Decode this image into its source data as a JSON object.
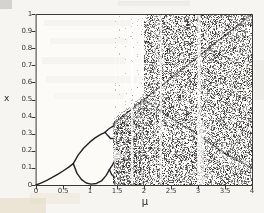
{
  "figure": {
    "paper_color": "#f6f5f1",
    "plot_bg": "#fcfbf8",
    "ink": "#232323",
    "tick_label_color": "#3a3a3a",
    "scan_artifacts": [
      {
        "x": 0,
        "y": 0,
        "w": 12,
        "h": 9,
        "color": "#6f6f6f",
        "opacity": 0.25
      },
      {
        "x": 118,
        "y": 1,
        "w": 72,
        "h": 5,
        "color": "#9a9a9a",
        "opacity": 0.1
      },
      {
        "x": 44,
        "y": 20,
        "w": 90,
        "h": 6,
        "color": "#9a9a9a",
        "opacity": 0.07
      },
      {
        "x": 50,
        "y": 38,
        "w": 78,
        "h": 6,
        "color": "#9a9a9a",
        "opacity": 0.06
      },
      {
        "x": 42,
        "y": 57,
        "w": 84,
        "h": 7,
        "color": "#9a9a9a",
        "opacity": 0.07
      },
      {
        "x": 46,
        "y": 76,
        "w": 96,
        "h": 7,
        "color": "#9a9a9a",
        "opacity": 0.06
      },
      {
        "x": 54,
        "y": 93,
        "w": 70,
        "h": 6,
        "color": "#9a9a9a",
        "opacity": 0.05
      },
      {
        "x": 0,
        "y": 198,
        "w": 46,
        "h": 15,
        "color": "#e0d3b6",
        "opacity": 0.45
      },
      {
        "x": 30,
        "y": 193,
        "w": 50,
        "h": 11,
        "color": "#e6dcc4",
        "opacity": 0.3
      },
      {
        "x": 254,
        "y": 60,
        "w": 10,
        "h": 40,
        "color": "#cfc8b8",
        "opacity": 0.15
      }
    ]
  },
  "chart_data": {
    "type": "scatter",
    "subtype": "bifurcation-diagram",
    "title": "",
    "xlabel": "μ",
    "ylabel": "x",
    "xlim": [
      0,
      4
    ],
    "ylim": [
      0,
      1
    ],
    "x_ticks": [
      0,
      0.5,
      1,
      1.5,
      2,
      2.5,
      3,
      3.5,
      4
    ],
    "x_tick_labels": [
      "0",
      "0.5",
      "1",
      "1.5",
      "2",
      "2.5",
      "3",
      "3.5",
      "4"
    ],
    "y_ticks": [
      0,
      0.1,
      0.2,
      0.3,
      0.4,
      0.5,
      0.6,
      0.7,
      0.8,
      0.9,
      1
    ],
    "y_tick_labels": [
      "0",
      "0.1",
      "0.2",
      "0.3",
      "0.4",
      "0.5",
      "0.6",
      "0.7",
      "0.8",
      "0.9",
      "1"
    ],
    "grid": false,
    "legend": null,
    "point_color": "#181818",
    "branches": [
      {
        "name": "fixed-point",
        "points": [
          [
            0,
            0
          ],
          [
            0.1,
            0.012
          ],
          [
            0.2,
            0.027
          ],
          [
            0.3,
            0.044
          ],
          [
            0.4,
            0.062
          ],
          [
            0.5,
            0.082
          ],
          [
            0.6,
            0.103
          ],
          [
            0.69,
            0.125
          ]
        ]
      },
      {
        "name": "period2-upper",
        "points": [
          [
            0.69,
            0.125
          ],
          [
            0.78,
            0.175
          ],
          [
            0.88,
            0.215
          ],
          [
            1.0,
            0.252
          ],
          [
            1.1,
            0.277
          ],
          [
            1.2,
            0.296
          ],
          [
            1.28,
            0.308
          ]
        ]
      },
      {
        "name": "period4-upper-a",
        "points": [
          [
            1.28,
            0.308
          ],
          [
            1.34,
            0.326
          ],
          [
            1.4,
            0.339
          ],
          [
            1.44,
            0.346
          ]
        ]
      },
      {
        "name": "period4-upper-b",
        "points": [
          [
            1.28,
            0.308
          ],
          [
            1.33,
            0.289
          ],
          [
            1.38,
            0.272
          ],
          [
            1.43,
            0.272
          ]
        ]
      },
      {
        "name": "period2-lower",
        "points": [
          [
            0.69,
            0.125
          ],
          [
            0.76,
            0.068
          ],
          [
            0.84,
            0.033
          ],
          [
            0.93,
            0.012
          ],
          [
            1.02,
            0.005
          ],
          [
            1.12,
            0.009
          ],
          [
            1.22,
            0.026
          ],
          [
            1.3,
            0.056
          ],
          [
            1.36,
            0.09
          ]
        ]
      },
      {
        "name": "period4-lower-a",
        "points": [
          [
            1.36,
            0.09
          ],
          [
            1.41,
            0.115
          ],
          [
            1.44,
            0.131
          ]
        ]
      },
      {
        "name": "period4-lower-b",
        "points": [
          [
            1.36,
            0.09
          ],
          [
            1.4,
            0.061
          ],
          [
            1.44,
            0.05
          ]
        ]
      }
    ],
    "balloons": [
      {
        "name": "period4-upper-loop",
        "between": [
          "period4-upper-a",
          "period4-upper-b"
        ]
      },
      {
        "name": "period4-lower-loop",
        "between": [
          "period4-lower-a",
          "period4-lower-b"
        ]
      }
    ],
    "chaos": {
      "onset_mu": 1.42,
      "full_band_mu": 2.0,
      "band_top_rule": "x = mu/4 for mu < 2, else 1",
      "density_band": 0.95,
      "density_full": 0.62,
      "ridges": [
        {
          "name": "critical-line",
          "points": [
            [
              1.42,
              0.355
            ],
            [
              2.0,
              0.5
            ],
            [
              3.0,
              0.75
            ],
            [
              4.0,
              1.0
            ]
          ],
          "alpha": 0.55,
          "width": 1.4,
          "light_offset": 3
        },
        {
          "name": "second-iterate",
          "points": [
            [
              2.0,
              0.5
            ],
            [
              2.5,
              0.39
            ],
            [
              3.0,
              0.295
            ],
            [
              3.5,
              0.185
            ],
            [
              4.0,
              0.1
            ]
          ],
          "alpha": 0.5,
          "width": 1.3,
          "light_offset": 3
        },
        {
          "name": "third-iterate",
          "points": [
            [
              3.05,
              0.02
            ],
            [
              3.5,
              0.15
            ],
            [
              4.0,
              0.4
            ]
          ],
          "alpha": 0.22,
          "width": 1.0,
          "light_offset": 0
        }
      ],
      "band_gaps": [
        {
          "polygon": [
            [
              1.42,
              0.125
            ],
            [
              1.42,
              0.215
            ],
            [
              1.63,
              0.17
            ]
          ],
          "alpha": 0.6
        }
      ],
      "windows": [
        {
          "mu": 1.47,
          "width": 0.012,
          "alpha": 0.5
        },
        {
          "mu": 1.545,
          "width": 0.01,
          "alpha": 0.4
        },
        {
          "mu": 1.66,
          "width": 0.015,
          "alpha": 0.5
        },
        {
          "mu": 1.78,
          "width": 0.045,
          "alpha": 0.88
        },
        {
          "mu": 1.885,
          "width": 0.02,
          "alpha": 0.6
        },
        {
          "mu": 1.965,
          "width": 0.025,
          "alpha": 0.55
        },
        {
          "mu": 2.21,
          "width": 0.02,
          "alpha": 0.55
        },
        {
          "mu": 2.31,
          "width": 0.04,
          "alpha": 0.85
        },
        {
          "mu": 2.56,
          "width": 0.014,
          "alpha": 0.45
        },
        {
          "mu": 2.72,
          "width": 0.012,
          "alpha": 0.35
        },
        {
          "mu": 3.02,
          "width": 0.06,
          "alpha": 0.88
        },
        {
          "mu": 3.05,
          "width": 0.13,
          "alpha": 0.7,
          "x_max": 0.38
        },
        {
          "mu": 3.16,
          "width": 0.02,
          "alpha": 0.5
        },
        {
          "mu": 3.45,
          "width": 0.014,
          "alpha": 0.4
        },
        {
          "mu": 3.63,
          "width": 0.018,
          "alpha": 0.5
        },
        {
          "mu": 3.74,
          "width": 0.012,
          "alpha": 0.35
        },
        {
          "mu": 3.9,
          "width": 0.016,
          "alpha": 0.45
        }
      ]
    }
  }
}
